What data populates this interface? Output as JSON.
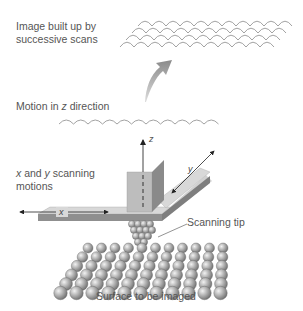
{
  "diagram": {
    "type": "scanning-tunneling-microscope",
    "labels": {
      "image_built_line1": "Image built up by",
      "image_built_line2": "successive scans",
      "motion_z_prefix": "Motion in ",
      "motion_z_var": "z",
      "motion_z_suffix": " direction",
      "xy_var_x": "x",
      "xy_and": " and ",
      "xy_var_y": "y",
      "xy_suffix": " scanning",
      "xy_line2": "motions",
      "scanning_tip": "Scanning tip",
      "surface": "Surface to be imaged"
    },
    "axis_labels": {
      "x": "x",
      "y": "y",
      "z": "z"
    },
    "colors": {
      "text": "#555555",
      "arc_stroke": "#8a8a8a",
      "arrow_fill": "#9a9a9a",
      "platform_top": "#d6d6d6",
      "platform_side": "#8e8e8e",
      "column_front": "#b9b9b9",
      "column_side": "#7d7d7d",
      "atom_fill": "#a8a8a8"
    }
  }
}
